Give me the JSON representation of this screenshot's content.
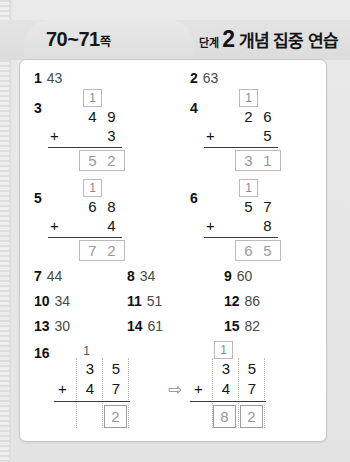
{
  "header": {
    "page_range": "70~71",
    "page_unit": "쪽",
    "stage_label": "단계",
    "stage_number": "2",
    "stage_title": "개념 집중 연습"
  },
  "icons": {
    "arrow_right": "⇨"
  },
  "colors": {
    "page_background": "#e6e6e6",
    "card_background": "#ffffff",
    "answer_gray": "#9a9a9a",
    "digit_black": "#141414",
    "box_border": "#b9b9b9"
  },
  "simple_problems": [
    {
      "number": "1",
      "answer": "43"
    },
    {
      "number": "2",
      "answer": "63"
    },
    {
      "number": "7",
      "answer": "44"
    },
    {
      "number": "8",
      "answer": "34"
    },
    {
      "number": "9",
      "answer": "60"
    },
    {
      "number": "10",
      "answer": "34"
    },
    {
      "number": "11",
      "answer": "51"
    },
    {
      "number": "12",
      "answer": "86"
    },
    {
      "number": "13",
      "answer": "30"
    },
    {
      "number": "14",
      "answer": "61"
    },
    {
      "number": "15",
      "answer": "82"
    }
  ],
  "vertical_problems": [
    {
      "number": "3",
      "carry": "1",
      "addend1_tens": "4",
      "addend1_ones": "9",
      "operator": "+",
      "addend2_tens": "",
      "addend2_ones": "3",
      "sum_tens": "5",
      "sum_ones": "2"
    },
    {
      "number": "4",
      "carry": "1",
      "addend1_tens": "2",
      "addend1_ones": "6",
      "operator": "+",
      "addend2_tens": "",
      "addend2_ones": "5",
      "sum_tens": "3",
      "sum_ones": "1"
    },
    {
      "number": "5",
      "carry": "1",
      "addend1_tens": "6",
      "addend1_ones": "8",
      "operator": "+",
      "addend2_tens": "",
      "addend2_ones": "4",
      "sum_tens": "7",
      "sum_ones": "2"
    },
    {
      "number": "6",
      "carry": "1",
      "addend1_tens": "5",
      "addend1_ones": "7",
      "operator": "+",
      "addend2_tens": "",
      "addend2_ones": "8",
      "sum_tens": "6",
      "sum_ones": "5"
    }
  ],
  "problem16": {
    "number": "16",
    "left": {
      "carry": "1",
      "addend1_tens": "3",
      "addend1_ones": "5",
      "operator": "+",
      "addend2_tens": "4",
      "addend2_ones": "7",
      "sum_tens": "",
      "sum_ones": "2"
    },
    "right": {
      "carry": "1",
      "addend1_tens": "3",
      "addend1_ones": "5",
      "operator": "+",
      "addend2_tens": "4",
      "addend2_ones": "7",
      "sum_tens": "8",
      "sum_ones": "2"
    }
  }
}
